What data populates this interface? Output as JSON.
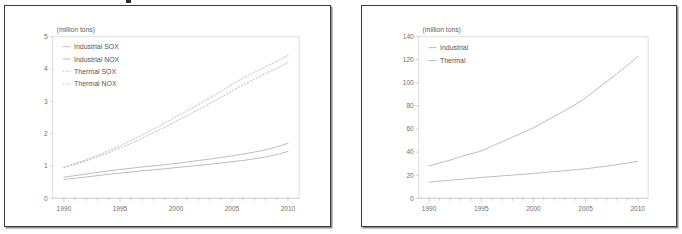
{
  "figure": {
    "background_color": "#ffffff",
    "panel_border_color": "#3a3a3a",
    "panel_shadow_color": "#8f8f8f",
    "line_color": "#b5b5b5",
    "text_color": "#707070",
    "axis_color": "#bfbfbf"
  },
  "panels": [
    {
      "name": "left-panel"
    },
    {
      "name": "right-panel"
    }
  ],
  "chart_data": [
    {
      "type": "line",
      "name": "left-chart",
      "title": "",
      "ylabel": "(million tons)",
      "xlabel": "",
      "xlim": [
        1989,
        2011
      ],
      "ylim": [
        0,
        5
      ],
      "grid": false,
      "legend_position": "top-left",
      "x_ticks": [
        "1990",
        "1995",
        "2000",
        "2005",
        "2010"
      ],
      "x_tick_values": [
        1990,
        1995,
        2000,
        2005,
        2010
      ],
      "x_minor_step": 1,
      "y_ticks": [
        "0",
        "1",
        "2",
        "3",
        "4",
        "5"
      ],
      "y_tick_values": [
        0,
        1,
        2,
        3,
        4,
        5
      ],
      "x": [
        1990,
        1991,
        1992,
        1993,
        1994,
        1995,
        1996,
        1997,
        1998,
        1999,
        2000,
        2001,
        2002,
        2003,
        2004,
        2005,
        2006,
        2007,
        2008,
        2009,
        2010
      ],
      "series": [
        {
          "name": "Industrial SOX",
          "style": "solid",
          "color": "#b5b5b5",
          "values": [
            0.65,
            0.7,
            0.75,
            0.8,
            0.85,
            0.89,
            0.93,
            0.97,
            1.0,
            1.04,
            1.08,
            1.12,
            1.17,
            1.21,
            1.26,
            1.31,
            1.37,
            1.43,
            1.5,
            1.59,
            1.7
          ]
        },
        {
          "name": "Industrial NOX",
          "style": "solid",
          "color": "#b5b5b5",
          "values": [
            0.58,
            0.62,
            0.66,
            0.7,
            0.74,
            0.78,
            0.81,
            0.85,
            0.88,
            0.91,
            0.95,
            0.98,
            1.02,
            1.05,
            1.09,
            1.13,
            1.17,
            1.22,
            1.28,
            1.35,
            1.45
          ]
        },
        {
          "name": "Thermal SOX",
          "style": "dotted",
          "color": "#bcbcbc",
          "values": [
            0.96,
            1.08,
            1.2,
            1.33,
            1.47,
            1.62,
            1.79,
            1.96,
            2.14,
            2.33,
            2.52,
            2.71,
            2.9,
            3.1,
            3.31,
            3.52,
            3.72,
            3.9,
            4.07,
            4.24,
            4.42
          ]
        },
        {
          "name": "Thermal NOX",
          "style": "dotted",
          "color": "#bcbcbc",
          "values": [
            0.95,
            1.05,
            1.16,
            1.28,
            1.41,
            1.55,
            1.7,
            1.86,
            2.03,
            2.2,
            2.38,
            2.56,
            2.74,
            2.93,
            3.12,
            3.32,
            3.51,
            3.69,
            3.86,
            4.02,
            4.2
          ]
        }
      ]
    },
    {
      "type": "line",
      "name": "right-chart",
      "title": "",
      "ylabel": "(million tons)",
      "xlabel": "",
      "xlim": [
        1989,
        2011
      ],
      "ylim": [
        0,
        140
      ],
      "grid": false,
      "legend_position": "top-left",
      "x_ticks": [
        "1990",
        "1995",
        "2000",
        "2005",
        "2010"
      ],
      "x_tick_values": [
        1990,
        1995,
        2000,
        2005,
        2010
      ],
      "x_minor_step": 1,
      "y_ticks": [
        "0",
        "20",
        "40",
        "60",
        "80",
        "100",
        "120",
        "140"
      ],
      "y_tick_values": [
        0,
        20,
        40,
        60,
        80,
        100,
        120,
        140
      ],
      "x": [
        1990,
        1991,
        1992,
        1993,
        1994,
        1995,
        1996,
        1997,
        1998,
        1999,
        2000,
        2001,
        2002,
        2003,
        2004,
        2005,
        2006,
        2007,
        2008,
        2009,
        2010
      ],
      "series": [
        {
          "name": "Industrial",
          "style": "solid",
          "color": "#b5b5b5",
          "values": [
            28,
            30.5,
            33,
            36,
            38.5,
            41,
            45,
            49,
            53,
            57,
            61,
            66,
            71,
            76,
            81,
            87,
            94,
            101,
            108,
            115,
            123
          ]
        },
        {
          "name": "Thermal",
          "style": "solid",
          "color": "#b5b5b5",
          "values": [
            14,
            14.8,
            15.6,
            16.4,
            17.2,
            18,
            18.7,
            19.4,
            20.1,
            20.8,
            21.5,
            22.3,
            23.1,
            23.9,
            24.7,
            25.5,
            26.7,
            27.9,
            29.1,
            30.5,
            32
          ]
        }
      ]
    }
  ]
}
